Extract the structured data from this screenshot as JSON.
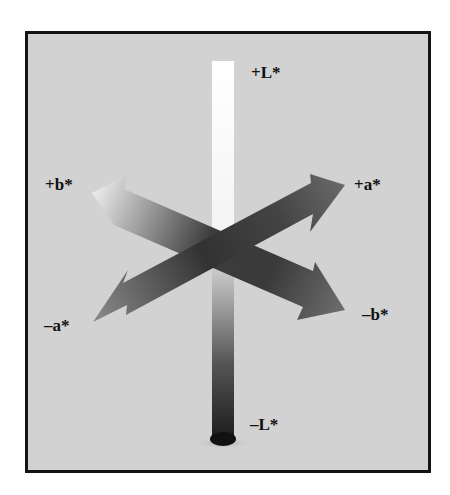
{
  "diagram": {
    "background_color": "#d2d2d2",
    "border_color": "#141414",
    "axes": [
      {
        "id": "L_plus",
        "label": "+L*",
        "description": "lightness axis, white end"
      },
      {
        "id": "L_minus",
        "label": "–L*",
        "description": "lightness axis, black end"
      },
      {
        "id": "a_plus",
        "label": "+a*",
        "description": "red direction"
      },
      {
        "id": "a_minus",
        "label": "–a*",
        "description": "green direction"
      },
      {
        "id": "b_plus",
        "label": "+b*",
        "description": "yellow direction"
      },
      {
        "id": "b_minus",
        "label": "–b*",
        "description": "blue direction"
      }
    ]
  },
  "labels": {
    "l_plus": "+L*",
    "l_minus": "–L*",
    "a_plus": "+a*",
    "a_minus": "–a*",
    "b_plus": "+b*",
    "b_minus": "–b*"
  }
}
